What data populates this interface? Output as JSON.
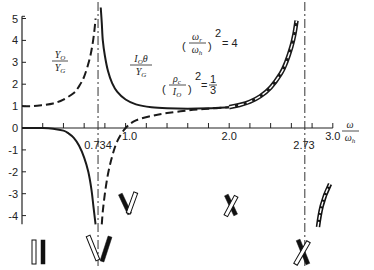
{
  "chart_data": {
    "type": "line",
    "title": "",
    "xlabel": "ω/ωh",
    "ylabel": "",
    "xlim": [
      0,
      3.0
    ],
    "ylim": [
      -4.4,
      5.4
    ],
    "grid": false,
    "x_ticks": [
      {
        "value": 1.0,
        "label": "1.0"
      },
      {
        "value": 2.0,
        "label": "2.0"
      },
      {
        "value": 3.0,
        "label": "3.0"
      }
    ],
    "x_minor_tick_step": 0.2,
    "y_ticks": [
      {
        "value": 5,
        "label": "5"
      },
      {
        "value": 4,
        "label": "4"
      },
      {
        "value": 3,
        "label": "3"
      },
      {
        "value": 2,
        "label": "2"
      },
      {
        "value": 1,
        "label": "1"
      },
      {
        "value": 0,
        "label": "0"
      },
      {
        "value": -1,
        "label": "-1"
      },
      {
        "value": -2,
        "label": "-2"
      },
      {
        "value": -3,
        "label": "-3"
      },
      {
        "value": -4,
        "label": "-4"
      }
    ],
    "vertical_markers": [
      {
        "x": 0.734,
        "label": "0.734",
        "style": "dash-dot"
      },
      {
        "x": 2.73,
        "label": "2.73",
        "style": "dash-dot"
      }
    ],
    "series": [
      {
        "name": "Y0/YG",
        "style": "dashed",
        "segments": [
          {
            "x": [
              0.0,
              0.1,
              0.2,
              0.3,
              0.4,
              0.5,
              0.55,
              0.6,
              0.65,
              0.68,
              0.7,
              0.71
            ],
            "y": [
              1.0,
              1.0,
              1.05,
              1.12,
              1.3,
              1.6,
              1.9,
              2.35,
              3.1,
              3.8,
              4.5,
              5.0
            ]
          },
          {
            "x": [
              0.77,
              0.78,
              0.8,
              0.83,
              0.87,
              0.92,
              1.0,
              1.1,
              1.25,
              1.4,
              1.6,
              1.8,
              2.0
            ],
            "y": [
              -4.4,
              -3.8,
              -3.0,
              -2.1,
              -1.3,
              -0.6,
              0.0,
              0.35,
              0.55,
              0.68,
              0.8,
              0.88,
              0.95
            ]
          }
        ]
      },
      {
        "name": "I0θ/YG",
        "style": "solid",
        "segments": [
          {
            "x": [
              0.0,
              0.2,
              0.3,
              0.4,
              0.45,
              0.5,
              0.55,
              0.6,
              0.64,
              0.67,
              0.69,
              0.71
            ],
            "y": [
              0.0,
              0.0,
              -0.03,
              -0.12,
              -0.25,
              -0.45,
              -0.8,
              -1.35,
              -2.0,
              -2.8,
              -3.6,
              -4.4
            ]
          },
          {
            "x": [
              0.76,
              0.77,
              0.78,
              0.8,
              0.83,
              0.87,
              0.92,
              1.0,
              1.1,
              1.25,
              1.4,
              1.6,
              1.8,
              2.0
            ],
            "y": [
              5.5,
              4.8,
              4.0,
              3.3,
              2.6,
              2.05,
              1.65,
              1.3,
              1.08,
              0.95,
              0.9,
              0.88,
              0.9,
              0.95
            ]
          }
        ]
      },
      {
        "name": "Y0/YG ≈ I0θ/YG (coincident)",
        "style": "double",
        "segments": [
          {
            "x": [
              2.0,
              2.1,
              2.2,
              2.3,
              2.4,
              2.5,
              2.55,
              2.6,
              2.63,
              2.65
            ],
            "y": [
              0.95,
              1.05,
              1.2,
              1.45,
              1.85,
              2.5,
              3.0,
              3.7,
              4.3,
              4.9
            ]
          }
        ]
      }
    ],
    "annotations": [
      {
        "text": "Y0/YG",
        "near": "dashed branch left of 0.734"
      },
      {
        "text": "I0θ/YG",
        "near": "solid branch right of 0.734"
      },
      {
        "text": "(ωr/ωh)² = 4"
      },
      {
        "text": "(ρc/I0)² = 1/3"
      }
    ],
    "mode_shape_symbols": [
      {
        "x_px": 40,
        "shape": "parallel bars (open, filled)"
      },
      {
        "x_px": 98,
        "shape": "V (open bar tilted right, filled bar tilted left)"
      },
      {
        "x_px": 128,
        "shape": "V (filled left, open right)"
      },
      {
        "x_px": 232,
        "shape": "X (filled and open crossing)"
      },
      {
        "x_px": 304,
        "shape": "X at 2.73"
      },
      {
        "x_px": 320,
        "shape": "double curved line (coincident branch continuation)"
      }
    ]
  },
  "labels": {
    "x_unit_num": "ω",
    "x_unit_den": "ωh",
    "marker_0734": "0.734",
    "marker_273": "2.73",
    "ann_y0_num": "Y",
    "ann_y0_num_sub": "O",
    "ann_y0_den": "Y",
    "ann_y0_den_sub": "G",
    "ann_i0_num": "I",
    "ann_i0_num_sub": "O",
    "ann_i0_num_tail": "θ",
    "ann_i0_den": "Y",
    "ann_i0_den_sub": "G",
    "ann_wr_num": "ω",
    "ann_wr_num_sub": "r",
    "ann_wr_den": "ω",
    "ann_wr_den_sub": "h",
    "ann_wr_rhs": "= 4",
    "ann_rho_num": "ρ",
    "ann_rho_num_sub": "c",
    "ann_rho_den": "I",
    "ann_rho_den_sub": "O",
    "ann_rho_rhs_num": "1",
    "ann_rho_rhs_den": "3",
    "ann_rho_eq": "=",
    "exp_2": "2"
  }
}
